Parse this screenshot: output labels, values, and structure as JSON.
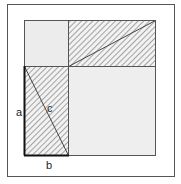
{
  "diagram": {
    "title": "",
    "labels": {
      "a": "a",
      "b": "b",
      "c": "c"
    },
    "colors": {
      "background": "#ffffff",
      "frame": "#555555",
      "square_fill": "#eeeeee",
      "hatch": "#555555",
      "edge": "#444444",
      "highlight_edge": "#111111"
    }
  }
}
